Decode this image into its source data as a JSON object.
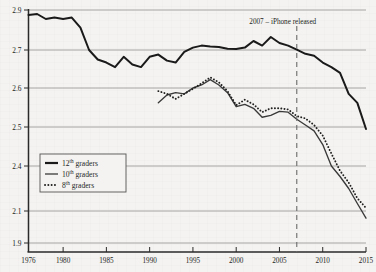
{
  "chart_data": {
    "type": "line",
    "title": "",
    "subtitle": "",
    "xlabel": "",
    "ylabel": "",
    "xlim": [
      1976,
      2015
    ],
    "ylim": [
      1.9,
      2.9
    ],
    "grid": true,
    "legend_position": "lower-left",
    "y_ticks": [
      "2.9",
      "2.7",
      "2.6",
      "2.5",
      "2.4",
      "2.1",
      "1.9"
    ],
    "y_tick_values": [
      2.9,
      2.7,
      2.6,
      2.5,
      2.4,
      2.1,
      1.9
    ],
    "x_ticks": [
      "1976",
      "1980",
      "1985",
      "1990",
      "1995",
      "2000",
      "2005",
      "2010",
      "2015"
    ],
    "x_tick_values": [
      1976,
      1980,
      1985,
      1990,
      1995,
      2000,
      2005,
      2010,
      2015
    ],
    "annotations": [
      {
        "name": "iphone-release-marker",
        "label": "2007 – iPhone released",
        "x": 2007,
        "style": "dashed-vertical-line"
      }
    ],
    "series": [
      {
        "name": "12th graders",
        "legend_label": "12",
        "legend_sup": "th",
        "legend_suffix": " graders",
        "style": "thick-solid",
        "color": "#1a1a1a",
        "x": [
          1976,
          1977,
          1978,
          1979,
          1980,
          1981,
          1982,
          1983,
          1984,
          1985,
          1986,
          1987,
          1988,
          1989,
          1990,
          1991,
          1992,
          1993,
          1994,
          1995,
          1996,
          1997,
          1998,
          1999,
          2000,
          2001,
          2002,
          2003,
          2004,
          2005,
          2006,
          2007,
          2008,
          2009,
          2010,
          2011,
          2012,
          2013,
          2014,
          2015
        ],
        "values": [
          2.875,
          2.88,
          2.855,
          2.862,
          2.855,
          2.862,
          2.812,
          2.7,
          2.675,
          2.667,
          2.655,
          2.682,
          2.662,
          2.655,
          2.682,
          2.688,
          2.672,
          2.667,
          2.695,
          2.712,
          2.722,
          2.718,
          2.715,
          2.706,
          2.705,
          2.712,
          2.745,
          2.722,
          2.765,
          2.735,
          2.722,
          2.702,
          2.69,
          2.685,
          2.667,
          2.655,
          2.64,
          2.585,
          2.562,
          2.495
        ]
      },
      {
        "name": "10th graders",
        "legend_label": "10",
        "legend_sup": "th",
        "legend_suffix": " graders",
        "style": "thin-solid",
        "color": "#3a3a3a",
        "x": [
          1991,
          1992,
          1993,
          1994,
          1995,
          1996,
          1997,
          1998,
          1999,
          2000,
          2001,
          2002,
          2003,
          2004,
          2005,
          2006,
          2007,
          2008,
          2009,
          2010,
          2011,
          2012,
          2013,
          2014,
          2015
        ],
        "values": [
          2.562,
          2.582,
          2.588,
          2.585,
          2.6,
          2.608,
          2.622,
          2.608,
          2.588,
          2.552,
          2.558,
          2.548,
          2.525,
          2.53,
          2.54,
          2.538,
          2.52,
          2.505,
          2.49,
          2.455,
          2.4,
          2.33,
          2.25,
          2.15,
          2.055
        ]
      },
      {
        "name": "8th graders",
        "legend_label": "8",
        "legend_sup": "th",
        "legend_suffix": " graders",
        "style": "dotted",
        "color": "#222222",
        "x": [
          1991,
          1992,
          1993,
          1994,
          1995,
          1996,
          1997,
          1998,
          1999,
          2000,
          2001,
          2002,
          2003,
          2004,
          2005,
          2006,
          2007,
          2008,
          2009,
          2010,
          2011,
          2012,
          2013,
          2014,
          2015
        ],
        "values": [
          2.592,
          2.585,
          2.572,
          2.585,
          2.598,
          2.612,
          2.628,
          2.615,
          2.592,
          2.556,
          2.57,
          2.558,
          2.538,
          2.548,
          2.548,
          2.545,
          2.528,
          2.522,
          2.505,
          2.478,
          2.432,
          2.368,
          2.29,
          2.185,
          2.12
        ]
      }
    ]
  },
  "legend": {
    "entries": [
      {
        "label": "12",
        "sup": "th",
        "suffix": " graders",
        "marker": "thick-solid"
      },
      {
        "label": "10",
        "sup": "th",
        "suffix": " graders",
        "marker": "thin-solid"
      },
      {
        "label": "8",
        "sup": "th",
        "suffix": " graders",
        "marker": "dotted"
      }
    ]
  },
  "colors": {
    "background": "#f4f3f1",
    "axis": "#2a2a2a",
    "gridline": "#8e8e8e",
    "series_12th": "#1a1a1a",
    "series_10th": "#3a3a3a",
    "series_8th": "#222222",
    "annotation_line": "#6b6b6b",
    "text": "#231f1d"
  }
}
